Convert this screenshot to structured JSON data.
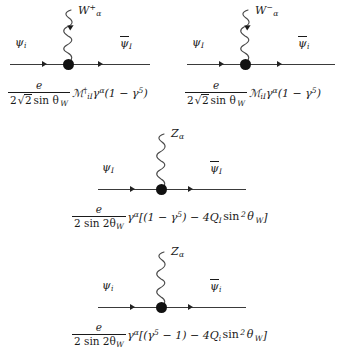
{
  "figure": {
    "name": "electroweak-vertex-feynman-rules",
    "background_color": "#ffffff",
    "line_color": "#3a3a3a",
    "text_color": "#1a1a1a",
    "diagram_count": 4
  },
  "diagrams": [
    {
      "id": "w-plus-vertex",
      "boson": {
        "symbol": "W",
        "charge_sup": "+",
        "index_sub": "α",
        "wave_arrow": "down",
        "wave_arrow_present": true
      },
      "incoming_fermion": {
        "symbol": "ψ",
        "sub": "i",
        "barred": false
      },
      "outgoing_fermion": {
        "symbol": "ψ",
        "sub": "I",
        "barred": true
      },
      "amplitude": {
        "numerator": "e",
        "denominator_prefix": "2",
        "denominator_sqrt": "2",
        "denominator_rest": "sin θ",
        "denominator_sub": "W",
        "matrix": "ℳ",
        "matrix_dagger": true,
        "matrix_sub": "iI",
        "gamma": "γ",
        "gamma_sup": "α",
        "chiral": "(1 − γ",
        "chiral_sup": "5",
        "chiral_close": ")"
      }
    },
    {
      "id": "w-minus-vertex",
      "boson": {
        "symbol": "W",
        "charge_sup": "−",
        "index_sub": "α",
        "wave_arrow": "down",
        "wave_arrow_present": true
      },
      "incoming_fermion": {
        "symbol": "ψ",
        "sub": "I",
        "barred": false
      },
      "outgoing_fermion": {
        "symbol": "ψ",
        "sub": "i",
        "barred": true
      },
      "amplitude": {
        "numerator": "e",
        "denominator_prefix": "2",
        "denominator_sqrt": "2",
        "denominator_rest": "sin θ",
        "denominator_sub": "W",
        "matrix": "ℳ",
        "matrix_dagger": false,
        "matrix_sub": "iI",
        "gamma": "γ",
        "gamma_sup": "α",
        "chiral": "(1 − γ",
        "chiral_sup": "5",
        "chiral_close": ")"
      }
    },
    {
      "id": "z-heavy-vertex",
      "boson": {
        "symbol": "Z",
        "charge_sup": "",
        "index_sub": "α",
        "wave_arrow": "none",
        "wave_arrow_present": false
      },
      "incoming_fermion": {
        "symbol": "ψ",
        "sub": "I",
        "barred": false
      },
      "outgoing_fermion": {
        "symbol": "ψ",
        "sub": "I",
        "barred": true
      },
      "amplitude": {
        "numerator": "e",
        "denominator_prefix": "2 sin 2θ",
        "denominator_sub": "W",
        "gamma": "γ",
        "gamma_sup": "α",
        "bracket_open": "[(1 − γ",
        "bracket_sup": "5",
        "bracket_mid": ") − 4Q",
        "charge_sub": "I",
        "sin_term": "sin",
        "sin_sup": "2",
        "theta": "θ",
        "theta_sub": "W",
        "bracket_close": "]"
      }
    },
    {
      "id": "z-light-vertex",
      "boson": {
        "symbol": "Z",
        "charge_sup": "",
        "index_sub": "α",
        "wave_arrow": "none",
        "wave_arrow_present": false
      },
      "incoming_fermion": {
        "symbol": "ψ",
        "sub": "i",
        "barred": false
      },
      "outgoing_fermion": {
        "symbol": "ψ",
        "sub": "i",
        "barred": true
      },
      "amplitude": {
        "numerator": "e",
        "denominator_prefix": "2 sin 2θ",
        "denominator_sub": "W",
        "gamma": "γ",
        "gamma_sup": "α",
        "bracket_open": "[(γ",
        "bracket_sup": "5",
        "bracket_mid": " − 1) − 4Q",
        "charge_sub": "i",
        "sin_term": "sin",
        "sin_sup": "2",
        "theta": "θ",
        "theta_sub": "W",
        "bracket_close": "]"
      }
    }
  ]
}
